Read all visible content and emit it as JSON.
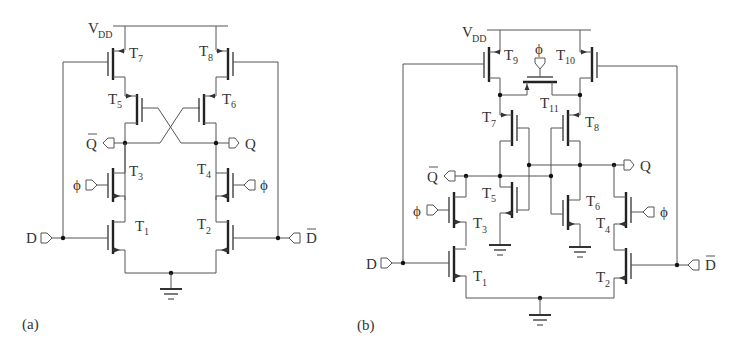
{
  "figure": {
    "panel_a": {
      "caption": "(a)",
      "supply": {
        "main": "V",
        "sub": "DD"
      },
      "transistors": [
        {
          "id": "T7",
          "main": "T",
          "sub": "7"
        },
        {
          "id": "T8",
          "main": "T",
          "sub": "8"
        },
        {
          "id": "T5",
          "main": "T",
          "sub": "5"
        },
        {
          "id": "T6",
          "main": "T",
          "sub": "6"
        },
        {
          "id": "T3",
          "main": "T",
          "sub": "3"
        },
        {
          "id": "T4",
          "main": "T",
          "sub": "4"
        },
        {
          "id": "T1",
          "main": "T",
          "sub": "1"
        },
        {
          "id": "T2",
          "main": "T",
          "sub": "2"
        }
      ],
      "terminals": {
        "qbar": "Q",
        "q": "Q",
        "phi_left": "ϕ",
        "phi_right": "ϕ",
        "d": "D",
        "dbar": "D"
      }
    },
    "panel_b": {
      "caption": "(b)",
      "supply": {
        "main": "V",
        "sub": "DD"
      },
      "transistors": [
        {
          "id": "T9",
          "main": "T",
          "sub": "9"
        },
        {
          "id": "T10",
          "main": "T",
          "sub": "10"
        },
        {
          "id": "T11",
          "main": "T",
          "sub": "11"
        },
        {
          "id": "T7",
          "main": "T",
          "sub": "7"
        },
        {
          "id": "T8",
          "main": "T",
          "sub": "8"
        },
        {
          "id": "T5",
          "main": "T",
          "sub": "5"
        },
        {
          "id": "T6",
          "main": "T",
          "sub": "6"
        },
        {
          "id": "T3",
          "main": "T",
          "sub": "3"
        },
        {
          "id": "T4",
          "main": "T",
          "sub": "4"
        },
        {
          "id": "T1",
          "main": "T",
          "sub": "1"
        },
        {
          "id": "T2",
          "main": "T",
          "sub": "2"
        }
      ],
      "terminals": {
        "phi_top": "ϕ",
        "qbar": "Q",
        "q": "Q",
        "phi_left": "ϕ",
        "phi_right": "ϕ",
        "d": "D",
        "dbar": "D"
      }
    }
  }
}
